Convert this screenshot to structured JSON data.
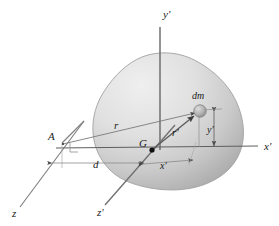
{
  "figure": {
    "background": "#ffffff",
    "body_fill_light": "#e8e8e8",
    "body_fill_dark": "#b6b6b6",
    "body_outline": "#9a9a9a",
    "axis_color": "#6b6b6b",
    "label_color": "#1a1a1a",
    "dm_fill": "#b0b0b0"
  },
  "labels": {
    "y_prime_axis": "y'",
    "x_prime_axis": "x'",
    "z_prime_axis": "z'",
    "z_axis": "z",
    "point_a": "A",
    "center_of_mass": "G",
    "mass_element": "dm",
    "radius_r": "r",
    "radius_r_prime": "r'",
    "distance_d": "d",
    "coord_x_prime": "x'",
    "coord_y_prime": "y'"
  },
  "geometry": {
    "point_a": [
      62,
      143
    ],
    "point_g": [
      152,
      150
    ],
    "point_dm": [
      199,
      113
    ],
    "origin_x_axis_y": 150,
    "x_axis_end": [
      258,
      146
    ],
    "y_axis_top": [
      163,
      24
    ],
    "z_axis_label_pos": [
      16,
      213
    ],
    "z_prime_label_pos": [
      101,
      211
    ]
  }
}
